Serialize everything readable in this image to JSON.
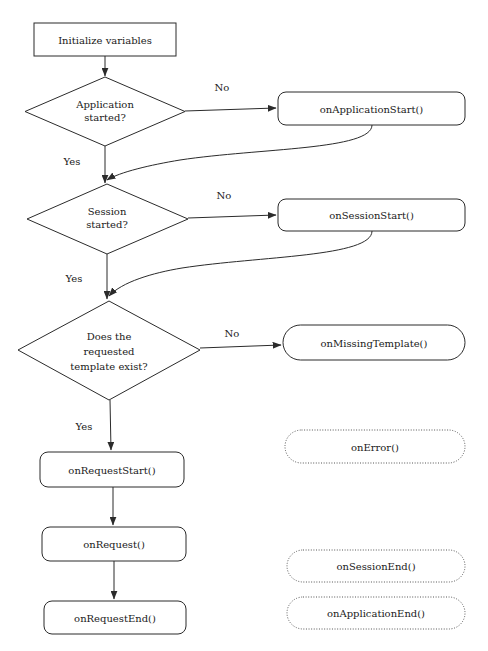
{
  "diagram": {
    "type": "flowchart",
    "background_color": "#ffffff",
    "line_color": "#2b2b2b",
    "dotted_line_color": "#555555",
    "text_color": "#1a1a1a"
  },
  "nodes": [
    {
      "id": "initialize-variables",
      "label": "Initialize variables",
      "shape": "rectangle",
      "border": "solid",
      "x": 34,
      "y": 23,
      "w": 142,
      "h": 33
    },
    {
      "id": "application-started",
      "label_lines": [
        "Application",
        "started?"
      ],
      "shape": "diamond",
      "border": "solid",
      "x": 25,
      "y": 77,
      "w": 160,
      "h": 69
    },
    {
      "id": "on-application-start",
      "label": "onApplicationStart()",
      "shape": "rounded-rectangle",
      "border": "solid",
      "x": 278,
      "y": 92,
      "w": 187,
      "h": 33
    },
    {
      "id": "session-started",
      "label_lines": [
        "Session",
        "started?"
      ],
      "shape": "diamond",
      "border": "solid",
      "x": 27,
      "y": 184,
      "w": 161,
      "h": 70
    },
    {
      "id": "on-session-start",
      "label": "onSessionStart()",
      "shape": "rounded-rectangle",
      "border": "solid",
      "x": 278,
      "y": 199,
      "w": 187,
      "h": 32
    },
    {
      "id": "template-exists",
      "label_lines": [
        "Does the",
        "requested",
        "template exist?"
      ],
      "shape": "diamond",
      "border": "solid",
      "x": 18,
      "y": 301,
      "w": 182,
      "h": 99
    },
    {
      "id": "on-missing-template",
      "label": "onMissingTemplate()",
      "shape": "pill",
      "border": "solid",
      "x": 283,
      "y": 325,
      "w": 182,
      "h": 35
    },
    {
      "id": "on-error",
      "label": "onError()",
      "shape": "pill",
      "border": "dotted",
      "x": 285,
      "y": 430,
      "w": 180,
      "h": 33
    },
    {
      "id": "on-request-start",
      "label": "onRequestStart()",
      "shape": "rounded-rectangle",
      "border": "solid",
      "x": 40,
      "y": 452,
      "w": 144,
      "h": 35
    },
    {
      "id": "on-request",
      "label": "onRequest()",
      "shape": "rounded-rectangle",
      "border": "solid",
      "x": 42,
      "y": 527,
      "w": 144,
      "h": 34
    },
    {
      "id": "on-session-end",
      "label": "onSessionEnd()",
      "shape": "pill",
      "border": "dotted",
      "x": 287,
      "y": 550,
      "w": 178,
      "h": 32
    },
    {
      "id": "on-request-end",
      "label": "onRequestEnd()",
      "shape": "rounded-rectangle",
      "border": "solid",
      "x": 44,
      "y": 601,
      "w": 142,
      "h": 33
    },
    {
      "id": "on-application-end",
      "label": "onApplicationEnd()",
      "shape": "pill",
      "border": "dotted",
      "x": 287,
      "y": 597,
      "w": 178,
      "h": 32
    }
  ],
  "edges": [
    {
      "id": "init-to-app-decision",
      "from": "initialize-variables",
      "to": "application-started",
      "label": "",
      "arrow": true
    },
    {
      "id": "app-no-to-on-application-start",
      "from": "application-started",
      "to": "on-application-start",
      "label": "No",
      "label_x": 222,
      "label_y": 91,
      "arrow": true
    },
    {
      "id": "on-application-start-return",
      "from": "on-application-start",
      "to": "session-started",
      "label": "",
      "arrow": true
    },
    {
      "id": "app-yes-to-session-decision",
      "from": "application-started",
      "to": "session-started",
      "label": "Yes",
      "label_x": 72,
      "label_y": 165,
      "arrow": true
    },
    {
      "id": "session-no-to-on-session-start",
      "from": "session-started",
      "to": "on-session-start",
      "label": "No",
      "label_x": 224,
      "label_y": 199,
      "arrow": true
    },
    {
      "id": "on-session-start-return",
      "from": "on-session-start",
      "to": "template-exists",
      "label": "",
      "arrow": true
    },
    {
      "id": "session-yes-to-template-decision",
      "from": "session-started",
      "to": "template-exists",
      "label": "Yes",
      "label_x": 74,
      "label_y": 282,
      "arrow": true
    },
    {
      "id": "template-no-to-on-missing-template",
      "from": "template-exists",
      "to": "on-missing-template",
      "label": "No",
      "label_x": 232,
      "label_y": 337,
      "arrow": true
    },
    {
      "id": "template-yes-to-on-request-start",
      "from": "template-exists",
      "to": "on-request-start",
      "label": "Yes",
      "label_x": 84,
      "label_y": 430,
      "arrow": true
    },
    {
      "id": "on-request-start-to-on-request",
      "from": "on-request-start",
      "to": "on-request",
      "label": "",
      "arrow": true
    },
    {
      "id": "on-request-to-on-request-end",
      "from": "on-request",
      "to": "on-request-end",
      "label": "",
      "arrow": true
    }
  ]
}
